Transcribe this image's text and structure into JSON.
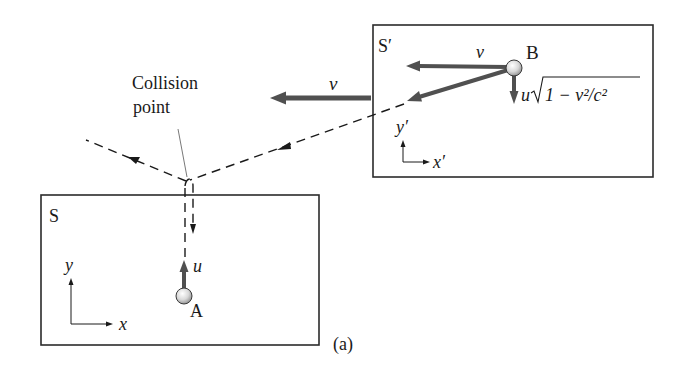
{
  "figure": {
    "label": "(a)",
    "colors": {
      "frame": "#2b2b2b",
      "velocity_arrow": "#505050",
      "dashed_path": "#1a1a1a",
      "ball_fill_light": "#f4f4f4",
      "ball_fill_dark": "#9a9a9a"
    }
  },
  "frame_s": {
    "name": "S",
    "axis_x": "x",
    "axis_y": "y",
    "ball": {
      "label": "A",
      "velocity_label": "u"
    }
  },
  "frame_s_prime": {
    "name": "S′",
    "axis_x": "x′",
    "axis_y": "y′",
    "ball": {
      "label": "B",
      "velocity_label": "v",
      "vertical_velocity_prefix": "u",
      "vertical_velocity_radicand": "1 − v²/c²"
    }
  },
  "frame_velocity": {
    "label": "v"
  },
  "collision": {
    "line1": "Collision",
    "line2": "point"
  }
}
